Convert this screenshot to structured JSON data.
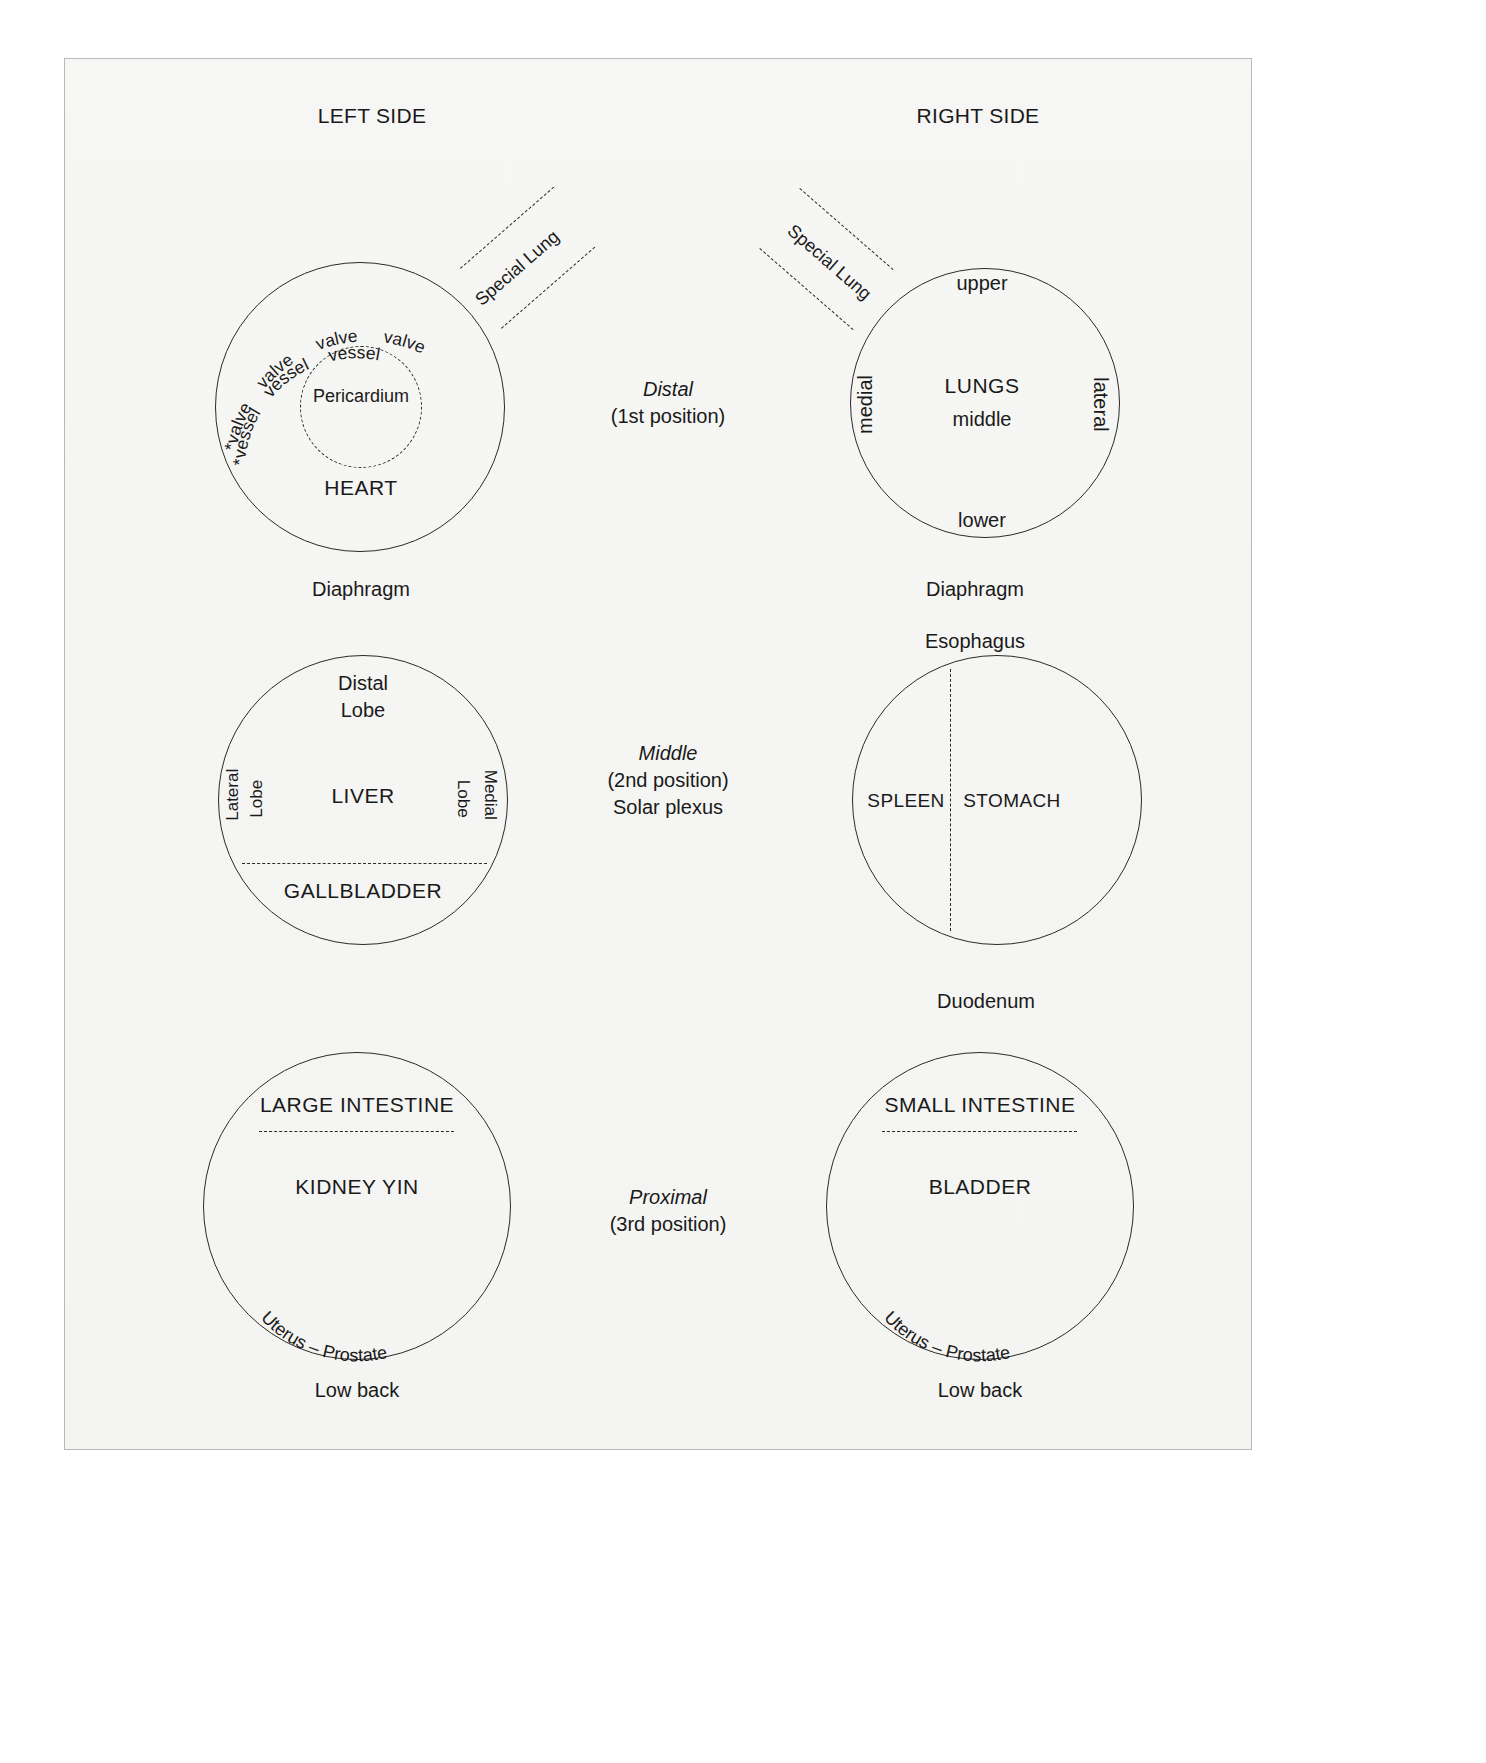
{
  "headers": {
    "left": "LEFT SIDE",
    "right": "RIGHT SIDE"
  },
  "center_column": [
    {
      "emphasis": "Distal",
      "position": "(1st position)",
      "extra": ""
    },
    {
      "emphasis": "Middle",
      "position": "(2nd position)",
      "extra": "Solar plexus"
    },
    {
      "emphasis": "Proximal",
      "position": "(3rd position)",
      "extra": ""
    }
  ],
  "left_column": {
    "row1": {
      "organ": "HEART",
      "inner_ring": "Pericardium",
      "arc_labels_outer": [
        "*valve",
        "valve",
        "valve",
        "valve"
      ],
      "arc_labels_inner": [
        "*vessel",
        "vessel",
        "vessel"
      ],
      "callout": "Special Lung",
      "below": "Diaphragm"
    },
    "row2": {
      "organ": "LIVER",
      "top": [
        "Distal",
        "Lobe"
      ],
      "left_side": [
        "Lateral",
        "Lobe"
      ],
      "right_side": [
        "Medial",
        "Lobe"
      ],
      "bottom_segment": "GALLBLADDER"
    },
    "row3": {
      "top_segment": "LARGE INTESTINE",
      "organ": "KIDNEY YIN",
      "arc_bottom": "Uterus – Prostate",
      "below": "Low back"
    }
  },
  "right_column": {
    "row1": {
      "organ": "LUNGS",
      "top": "upper",
      "center": "middle",
      "bottom": "lower",
      "left_side": "medial",
      "right_side": "lateral",
      "callout": "Special Lung",
      "below": [
        "Diaphragm",
        "Esophagus"
      ]
    },
    "row2": {
      "left_organ": "SPLEEN",
      "right_organ": "STOMACH",
      "below": "Duodenum"
    },
    "row3": {
      "top_segment": "SMALL INTESTINE",
      "organ": "BLADDER",
      "arc_bottom": "Uterus – Prostate",
      "below": "Low back"
    }
  },
  "colors": {
    "ink": "#1a1a1a",
    "stroke": "#2a2a2a",
    "plate_bg": "#f5f5f3",
    "frame": "#b9b9b9"
  }
}
